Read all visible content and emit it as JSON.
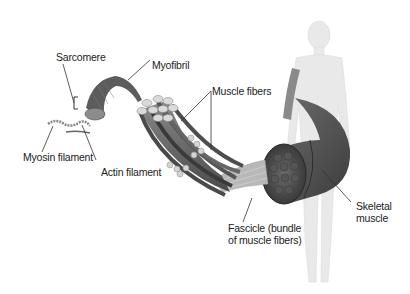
{
  "diagram": {
    "labels": {
      "sarcomere": "Sarcomere",
      "myofibril": "Myofibril",
      "muscle_fibers": "Muscle fibers",
      "myosin_filament": "Myosin filament",
      "actin_filament": "Actin filament",
      "fascicle_line1": "Fascicle (bundle",
      "fascicle_line2": "of muscle fibers)",
      "skeletal_line1": "Skeletal",
      "skeletal_line2": "muscle"
    },
    "colors": {
      "background": "#ffffff",
      "text": "#222222",
      "leader_line": "#333333",
      "muscle_dark": "#4a4a4a",
      "muscle_mid": "#7a7a7a",
      "fiber_end": "#d8d8d8",
      "body_silhouette": "#e6e6e6"
    }
  }
}
